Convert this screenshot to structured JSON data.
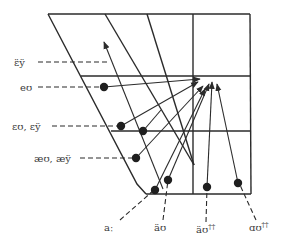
{
  "diagram": {
    "type": "vowel-quadrilateral-diphthong-trajectories",
    "colors": {
      "line": "#2b2b2b",
      "dot": "#1f1f1f",
      "text": "#3a3a3a",
      "background": "#ffffff"
    },
    "left_labels": [
      {
        "id": "eey",
        "text": "ɛ̈ÿ"
      },
      {
        "id": "eu",
        "text": "eʊ"
      },
      {
        "id": "eu_ey",
        "text": "ɛʊ, ɛÿ"
      },
      {
        "id": "aeu_aey",
        "text": "æʊ, æÿ"
      }
    ],
    "bottom_labels": [
      {
        "id": "a_long",
        "text": "aː"
      },
      {
        "id": "a_umlaut_u",
        "text": "äʊ"
      },
      {
        "id": "a_double_u",
        "text": "ӓʊ",
        "sup": "††"
      },
      {
        "id": "alpha_u",
        "text": "ɑʊ",
        "sup": "††"
      }
    ],
    "target_region": "upper-mid back (ʊ)"
  }
}
